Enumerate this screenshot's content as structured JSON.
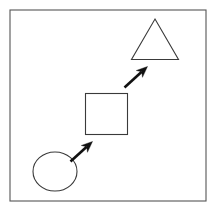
{
  "diagram": {
    "title": "Shape progression diagram",
    "canvas": {
      "width": 219,
      "height": 214,
      "background_color": "#ffffff"
    },
    "frame": {
      "label": "outer frame",
      "x": 10,
      "y": 10,
      "width": 196,
      "height": 191,
      "stroke_color": "#555555",
      "fill_color": "#ffffff",
      "stroke_width": 1.1
    },
    "shape_stroke_color": "#3a3a3a",
    "shape_fill_color": "#ffffff",
    "arrow_color": "#111111",
    "shapes": [
      {
        "name": "circle",
        "order": 1,
        "label": "circle",
        "cx": 55,
        "cy": 171.5,
        "rx": 22,
        "ry": 19.5,
        "position": "bottom-left"
      },
      {
        "name": "square",
        "order": 2,
        "label": "square",
        "x": 85.5,
        "y": 93.5,
        "width": 42,
        "height": 41,
        "position": "center"
      },
      {
        "name": "triangle",
        "order": 3,
        "label": "triangle",
        "points": "155,19 178.5,59.5 131.5,59.5",
        "apex_x": 155,
        "apex_y": 19,
        "base_y": 59.5,
        "base_left_x": 131.5,
        "base_right_x": 178.5,
        "position": "top-right"
      }
    ],
    "arrows": [
      {
        "name": "arrow-circle-to-square",
        "order": 1,
        "label": "arrow from circle to square",
        "from": "circle",
        "to": "square",
        "tail_x": 70.5,
        "tail_y": 161.5,
        "tip_x": 92.5,
        "tip_y": 141.5,
        "direction": "up-right"
      },
      {
        "name": "arrow-square-to-triangle",
        "order": 2,
        "label": "arrow from square to triangle",
        "from": "square",
        "to": "triangle",
        "tail_x": 124.5,
        "tail_y": 87.5,
        "tip_x": 147.5,
        "tip_y": 66.5,
        "direction": "up-right"
      }
    ]
  }
}
